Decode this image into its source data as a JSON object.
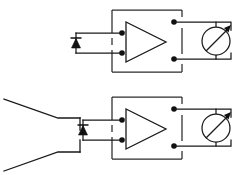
{
  "figure": {
    "background_color": "#ffffff",
    "line_color": "#1a1a1a",
    "width": 249,
    "height": 175,
    "circuit_count": 2
  },
  "circuits": [
    {
      "id": "upper-circuit",
      "label": "Upper detector circuit",
      "has_horn_antenna": false,
      "components": [
        {
          "name": "diode",
          "symbol": "diode-symbol",
          "orientation": "vertical-up"
        },
        {
          "name": "amplifier",
          "symbol": "triangle-amplifier",
          "terminal_count": 4
        },
        {
          "name": "meter",
          "symbol": "meter-with-needle",
          "needle_direction": "up-right"
        }
      ]
    },
    {
      "id": "lower-circuit",
      "label": "Lower detector circuit with horn antenna",
      "has_horn_antenna": true,
      "components": [
        {
          "name": "horn-antenna",
          "symbol": "horn-flare",
          "orientation": "left-facing"
        },
        {
          "name": "diode",
          "symbol": "diode-symbol",
          "orientation": "vertical-up"
        },
        {
          "name": "amplifier",
          "symbol": "triangle-amplifier",
          "terminal_count": 4
        },
        {
          "name": "meter",
          "symbol": "meter-with-needle",
          "needle_direction": "up-right"
        }
      ]
    }
  ],
  "annotations": {
    "text_labels": [],
    "note": "No visible text labels in the diagram"
  }
}
